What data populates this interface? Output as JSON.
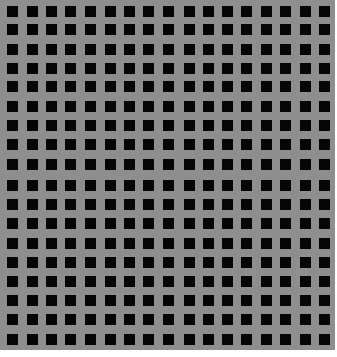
{
  "image": {
    "description": "Grid of black squares on a gray background",
    "background_color": "#8e8e8e",
    "square_color": "#060606",
    "columns": 17,
    "rows": 18,
    "square_size_px": 11,
    "col_positions": [
      7,
      27,
      46,
      65,
      85,
      105,
      124,
      143,
      163,
      184,
      203,
      222,
      241,
      261,
      280,
      300,
      319
    ],
    "row_positions": [
      6,
      24,
      44,
      63,
      81,
      101,
      120,
      139,
      159,
      180,
      199,
      218,
      238,
      257,
      276,
      295,
      314,
      334
    ]
  }
}
